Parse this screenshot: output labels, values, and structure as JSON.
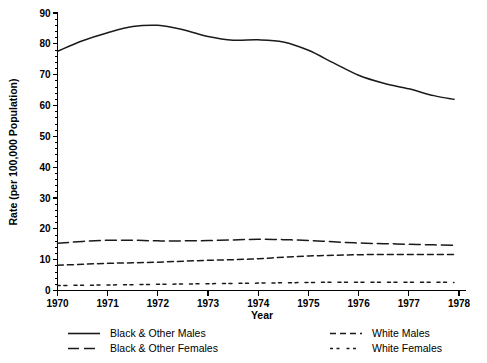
{
  "chart_data": {
    "type": "line",
    "title": "",
    "xlabel": "Year",
    "ylabel": "Rate (per 100,000 Population)",
    "xlim": [
      1970,
      1978
    ],
    "ylim": [
      0,
      90
    ],
    "y_ticks": [
      0,
      10,
      20,
      30,
      40,
      50,
      60,
      70,
      80,
      90
    ],
    "y_tick_labels": [
      "0",
      "10",
      "20",
      "30",
      "40",
      "50",
      "60",
      "70",
      "80",
      "90"
    ],
    "y_minor_step": 2,
    "x_ticks": [
      1970,
      1971,
      1972,
      1973,
      1974,
      1975,
      1976,
      1977,
      1978
    ],
    "x_tick_labels": [
      "1970",
      "1971",
      "1972",
      "1973",
      "1974",
      "1975",
      "1976",
      "1977",
      "1978"
    ],
    "grid": false,
    "legend_position": "below",
    "x": [
      1970,
      1970.5,
      1971,
      1971.5,
      1972,
      1972.5,
      1973,
      1973.5,
      1974,
      1974.5,
      1975,
      1975.5,
      1976,
      1976.5,
      1977,
      1977.5,
      1977.9
    ],
    "series": [
      {
        "name": "Black & Other Males",
        "dash": "solid",
        "color": "#1a1a1a",
        "values": [
          77.6,
          81.0,
          83.6,
          85.6,
          86.0,
          84.6,
          82.4,
          81.2,
          81.3,
          80.6,
          77.9,
          73.8,
          69.8,
          67.2,
          65.4,
          63.2,
          62.0
        ]
      },
      {
        "name": "Black & Other Females",
        "dash": "long-dash",
        "color": "#1a1a1a",
        "values": [
          15.3,
          15.9,
          16.3,
          16.3,
          16.1,
          16.1,
          16.2,
          16.4,
          16.6,
          16.5,
          16.2,
          15.8,
          15.4,
          15.2,
          15.0,
          14.8,
          14.7
        ]
      },
      {
        "name": "White Males",
        "dash": "medium-dash",
        "color": "#1a1a1a",
        "values": [
          8.2,
          8.5,
          8.8,
          9.0,
          9.2,
          9.5,
          9.8,
          10.0,
          10.3,
          10.8,
          11.2,
          11.4,
          11.6,
          11.7,
          11.7,
          11.7,
          11.7
        ]
      },
      {
        "name": "White Females",
        "dash": "dotted",
        "color": "#1a1a1a",
        "values": [
          1.6,
          1.7,
          1.8,
          1.9,
          2.0,
          2.1,
          2.2,
          2.3,
          2.4,
          2.5,
          2.6,
          2.7,
          2.7,
          2.7,
          2.7,
          2.7,
          2.6
        ]
      }
    ]
  },
  "axes": {
    "x_title": "Year",
    "y_title": "Rate (per 100,000 Population)"
  },
  "legend": {
    "entries": [
      {
        "label": "Black & Other Males",
        "dash": "solid",
        "column": 0,
        "row": 0
      },
      {
        "label": "Black & Other Females",
        "dash": "long-dash",
        "column": 0,
        "row": 1
      },
      {
        "label": "White Males",
        "dash": "medium-dash",
        "column": 1,
        "row": 0
      },
      {
        "label": "White Females",
        "dash": "dotted",
        "column": 1,
        "row": 1
      }
    ]
  },
  "ticks": {
    "y": [
      "0",
      "10",
      "20",
      "30",
      "40",
      "50",
      "60",
      "70",
      "80",
      "90"
    ],
    "x": [
      "1970",
      "1971",
      "1972",
      "1973",
      "1974",
      "1975",
      "1976",
      "1977",
      "1978"
    ]
  },
  "colors": {
    "ink": "#000000",
    "line": "#1a1a1a",
    "background": "#ffffff"
  }
}
